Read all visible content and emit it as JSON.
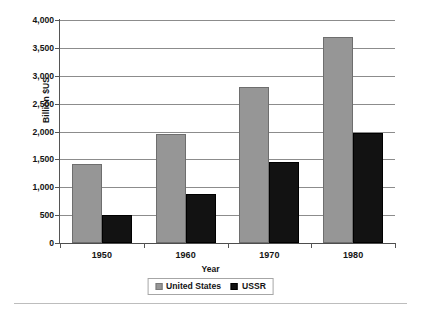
{
  "chart_data": {
    "type": "bar",
    "title": "",
    "xlabel": "Year",
    "ylabel": "Billion $US",
    "categories": [
      "1950",
      "1960",
      "1970",
      "1980"
    ],
    "series": [
      {
        "name": "United States",
        "color": "#969696",
        "values": [
          1420,
          1950,
          2790,
          3690
        ]
      },
      {
        "name": "USSR",
        "color": "#121212",
        "values": [
          510,
          880,
          1460,
          1980
        ]
      }
    ],
    "ylim": [
      0,
      4000
    ],
    "ytick_values": [
      4000,
      3500,
      3000,
      2500,
      2000,
      1500,
      1000,
      500,
      0
    ],
    "ytick_labels": [
      "4,000",
      "3,500",
      "3,000",
      "2,500",
      "2,000",
      "1,500",
      "1,000",
      "500",
      "0"
    ],
    "grid": true,
    "grid_axis": "y",
    "legend_position": "bottom-center"
  },
  "axes": {
    "y_title": "Billion $US",
    "x_title": "Year"
  },
  "legend": {
    "entries": [
      {
        "label": "United States",
        "swatch": "gray-square-swatch"
      },
      {
        "label": "USSR",
        "swatch": "black-square-swatch"
      }
    ]
  }
}
